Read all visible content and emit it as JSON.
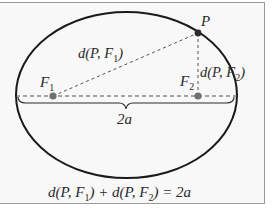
{
  "diagram": {
    "labels": {
      "point": "P",
      "focus1": "F",
      "focus1_sub": "1",
      "focus2": "F",
      "focus2_sub": "2",
      "dist1_prefix": "d(P, F",
      "dist1_sub": "1",
      "dist1_suffix": ")",
      "dist2_prefix": "d(P, F",
      "dist2_sub": "2",
      "dist2_suffix": ")",
      "major_axis": "2a"
    },
    "equation": {
      "part1": "d(P, F",
      "sub1": "1",
      "part2": ") + d(P, F",
      "sub2": "2",
      "part3": ") = 2a"
    },
    "colors": {
      "ellipse": "#1a1a1a",
      "focus": "#707070",
      "point": "#2a2a2a",
      "dashed": "#505050",
      "frame": "#9a9a9a",
      "background": "#f8f8f8"
    }
  }
}
